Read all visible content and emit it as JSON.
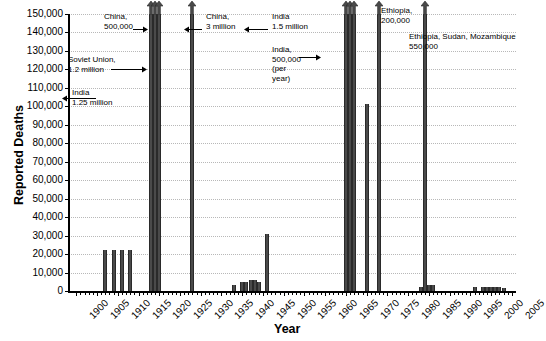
{
  "chart_data": {
    "type": "bar",
    "title": "",
    "xlabel": "Year",
    "ylabel": "Reported Deaths",
    "ylim": [
      0,
      150000
    ],
    "xlim": [
      1898,
      2006
    ],
    "ytick_step": 10000,
    "ytick_labels": [
      "0",
      "10,000",
      "20,000",
      "30,000",
      "40,000",
      "50,000",
      "60,000",
      "70,000",
      "80,000",
      "90,000",
      "100,000",
      "110,000",
      "120,000",
      "130,000",
      "140,000",
      "150,000"
    ],
    "ytick_values": [
      0,
      10000,
      20000,
      30000,
      40000,
      50000,
      60000,
      70000,
      80000,
      90000,
      100000,
      110000,
      120000,
      130000,
      140000,
      150000
    ],
    "xtick_labels": [
      "1900",
      "1905",
      "1910",
      "1915",
      "1920",
      "1925",
      "1930",
      "1935",
      "1940",
      "1945",
      "1950",
      "1955",
      "1960",
      "1965",
      "1970",
      "1975",
      "1980",
      "1985",
      "1990",
      "1995",
      "2000",
      "2005"
    ],
    "xtick_values": [
      1900,
      1905,
      1910,
      1915,
      1920,
      1925,
      1930,
      1935,
      1940,
      1945,
      1950,
      1955,
      1960,
      1965,
      1970,
      1975,
      1980,
      1985,
      1990,
      1995,
      2000,
      2005
    ],
    "grid": true,
    "legend": "none",
    "bar_color": "#4a4a4a",
    "note": "Bars drawn with an up-arrow cap exceed the 150,000 axis maximum; their true magnitudes are given in the text annotations.",
    "bars": [
      {
        "year": 1907,
        "value": 22000,
        "capped": false
      },
      {
        "year": 1909,
        "value": 22000,
        "capped": false
      },
      {
        "year": 1911,
        "value": 22000,
        "capped": false
      },
      {
        "year": 1913,
        "value": 22000,
        "capped": false
      },
      {
        "year": 1918,
        "value": 150000,
        "capped": true
      },
      {
        "year": 1919,
        "value": 150000,
        "capped": true
      },
      {
        "year": 1920,
        "value": 150000,
        "capped": true
      },
      {
        "year": 1928,
        "value": 150000,
        "capped": true
      },
      {
        "year": 1938,
        "value": 3000,
        "capped": false
      },
      {
        "year": 1940,
        "value": 5000,
        "capped": false
      },
      {
        "year": 1941,
        "value": 5000,
        "capped": false
      },
      {
        "year": 1942,
        "value": 6000,
        "capped": false
      },
      {
        "year": 1943,
        "value": 6000,
        "capped": false
      },
      {
        "year": 1944,
        "value": 5000,
        "capped": false
      },
      {
        "year": 1946,
        "value": 31000,
        "capped": false
      },
      {
        "year": 1965,
        "value": 150000,
        "capped": true
      },
      {
        "year": 1966,
        "value": 150000,
        "capped": true
      },
      {
        "year": 1967,
        "value": 150000,
        "capped": true
      },
      {
        "year": 1970,
        "value": 101000,
        "capped": false
      },
      {
        "year": 1973,
        "value": 150000,
        "capped": true
      },
      {
        "year": 1983,
        "value": 2000,
        "capped": false
      },
      {
        "year": 1984,
        "value": 150000,
        "capped": true
      },
      {
        "year": 1985,
        "value": 3000,
        "capped": false
      },
      {
        "year": 1986,
        "value": 3000,
        "capped": false
      },
      {
        "year": 1996,
        "value": 2000,
        "capped": false
      },
      {
        "year": 1998,
        "value": 2000,
        "capped": false
      },
      {
        "year": 1999,
        "value": 2000,
        "capped": false
      },
      {
        "year": 2000,
        "value": 2000,
        "capped": false
      },
      {
        "year": 2001,
        "value": 2000,
        "capped": false
      },
      {
        "year": 2002,
        "value": 2000,
        "capped": false
      },
      {
        "year": 2003,
        "value": 1500,
        "capped": false
      }
    ],
    "annotations": [
      {
        "id": "china-1920",
        "text": "China,\n500,000",
        "target_year": 1920,
        "x": 104,
        "y": 12,
        "arrow": "right",
        "arrow_x": 133,
        "arrow_y": 22,
        "arrow_len": 15
      },
      {
        "id": "soviet-union-1920",
        "text": "Soviet Union,\n1.2 million",
        "target_year": 1920,
        "x": 68,
        "y": 55,
        "arrow": "right",
        "arrow_x": 111,
        "arrow_y": 62,
        "arrow_len": 36
      },
      {
        "id": "india-1918",
        "text": "India\n1.25 million",
        "target_year": 1918,
        "x": 72,
        "y": 88,
        "arrow": "left",
        "arrow_x": 62,
        "arrow_y": 91,
        "arrow_len": 34
      },
      {
        "id": "china-1928",
        "text": "China,\n3 million",
        "target_year": 1928,
        "x": 206,
        "y": 12,
        "arrow": "left",
        "arrow_x": 184,
        "arrow_y": 22,
        "arrow_len": 18
      },
      {
        "id": "india-1965",
        "text": "India\n1.5 million",
        "target_year": 1965,
        "x": 272,
        "y": 12,
        "arrow": "left",
        "arrow_x": 244,
        "arrow_y": 22,
        "arrow_len": 24
      },
      {
        "id": "india-1966",
        "text": "India,\n500,000\n(per\nyear)",
        "target_year": 1966,
        "x": 272,
        "y": 45,
        "arrow": "right",
        "arrow_x": 299,
        "arrow_y": 50,
        "arrow_len": 22
      },
      {
        "id": "ethiopia-1973",
        "text": "Ethiopia,\n200,000",
        "target_year": 1973,
        "x": 381,
        "y": 6,
        "arrow": "none",
        "arrow_x": 0,
        "arrow_y": 0,
        "arrow_len": 0
      },
      {
        "id": "ethiopia-sudan-mozambique-1984",
        "text": "Ethiopia, Sudan, Mozambique\n550,000",
        "target_year": 1984,
        "x": 409,
        "y": 32,
        "arrow": "none",
        "arrow_x": 0,
        "arrow_y": 0,
        "arrow_len": 0
      }
    ]
  },
  "axes": {
    "y_title": "Reported Deaths",
    "x_title": "Year"
  }
}
